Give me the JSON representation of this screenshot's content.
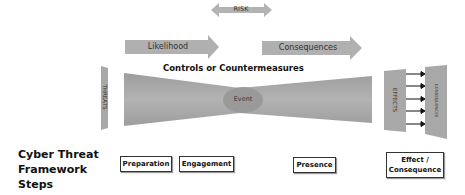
{
  "diagram": {
    "risk_label": "RISK",
    "likelihood_label": "Likelihood",
    "consequences_label": "Consequences",
    "controls_label": "Controls or Countermeasures",
    "threats_label": "THREATS",
    "event_label": "Event",
    "effects_label": "EFFECTS",
    "consequences_panel_label": "CONSEQUENCES",
    "effect_arrow_count": 5
  },
  "framework": {
    "title_line1": "Cyber Threat",
    "title_line2": "Framework",
    "title_line3": "Steps",
    "steps": [
      {
        "label": "Preparation"
      },
      {
        "label": "Engagement"
      },
      {
        "label": "Presence"
      },
      {
        "label_line1": "Effect /",
        "label_line2": "Consequence"
      }
    ]
  },
  "colors": {
    "shape_fill": "#a8a8a8",
    "shape_dark": "#959595",
    "arrow_fill": "#b0b0b0",
    "text": "#111111"
  }
}
